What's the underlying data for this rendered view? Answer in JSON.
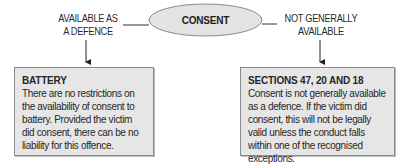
{
  "diagram": {
    "center_node": {
      "label": "CONSENT",
      "fill": "#e3e3e3",
      "stroke": "#8a8a8a"
    },
    "branches": [
      {
        "label_lines": [
          "AVAILABLE AS",
          "A DEFENCE"
        ],
        "box": {
          "title": "BATTERY",
          "body": "There are no restrictions on the availability of consent to battery. Provided the victim did consent, there can be no liability for this offence."
        }
      },
      {
        "label_lines": [
          "NOT GENERALLY",
          "AVAILABLE"
        ],
        "box": {
          "title": "SECTIONS 47, 20 AND 18",
          "body": "Consent is not generally available as a defence. If the victim did consent, this will not be legally valid unless the conduct falls within one of the recognised exceptions."
        }
      }
    ],
    "colors": {
      "box_fill": "#e6e6e6",
      "line": "#333333",
      "text": "#262626"
    }
  }
}
